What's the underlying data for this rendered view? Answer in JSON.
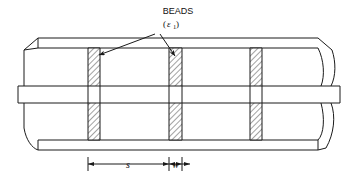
{
  "figure": {
    "kind": "engineering-line-drawing",
    "background_color": "#ffffff",
    "line_color": "#1a1a1a",
    "hatch_color": "#555555"
  },
  "labels": {
    "beads_title": "BEADS",
    "beads_permittivity_open": "(",
    "beads_permittivity_symbol": "ε",
    "beads_permittivity_subscript": "1",
    "beads_permittivity_close": ")"
  },
  "dimensions": [
    {
      "name": "bead-spacing",
      "label": "s",
      "from_x": 88,
      "to_x": 169
    },
    {
      "name": "bead-width",
      "label": "w",
      "from_x": 169,
      "to_x": 182
    }
  ],
  "beads": [
    {
      "index": 1,
      "x": 88,
      "width": 12
    },
    {
      "index": 2,
      "x": 169,
      "width": 13
    },
    {
      "index": 3,
      "x": 250,
      "width": 12
    }
  ],
  "geometry": {
    "outer_top_y": 38,
    "outer_top_inner_y": 48,
    "outer_bottom_inner_y": 140,
    "outer_bottom_y": 150,
    "inner_conductor_top_y": 86,
    "inner_conductor_bottom_y": 103,
    "inner_conductor_left_x": 18,
    "inner_conductor_right_x": 340,
    "body_left_x": 38,
    "body_right_x": 318
  },
  "leaders": [
    {
      "name": "leader-to-bead-1",
      "apex_x": 155,
      "apex_y": 34,
      "tip_x": 96,
      "tip_y": 57
    },
    {
      "name": "leader-to-bead-2",
      "apex_x": 160,
      "apex_y": 34,
      "tip_x": 176,
      "tip_y": 58
    }
  ]
}
